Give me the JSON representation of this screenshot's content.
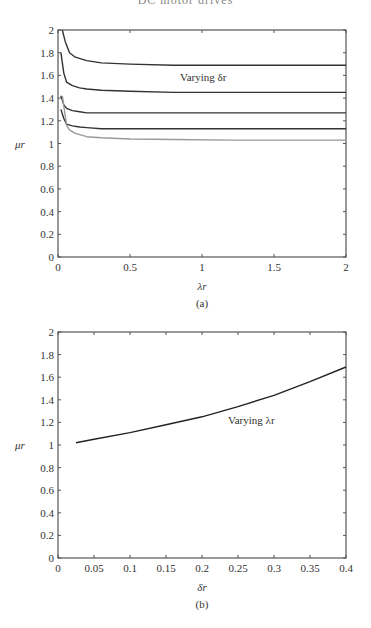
{
  "header": {
    "text": "DC motor drives"
  },
  "chart_data": [
    {
      "type": "line",
      "caption": "(a)",
      "title": "",
      "xlabel": "λr",
      "ylabel": "μr",
      "xlim": [
        0,
        2
      ],
      "ylim": [
        0,
        2
      ],
      "xticks": [
        "0",
        "0.5",
        "1",
        "1.5",
        "2"
      ],
      "yticks": [
        "0",
        "0.2",
        "0.4",
        "0.6",
        "0.8",
        "1",
        "1.2",
        "1.4",
        "1.6",
        "1.8",
        "2"
      ],
      "grid": false,
      "annotation": "Varying δr",
      "series": [
        {
          "name": "curve-1",
          "color": "#333333",
          "x": [
            0.03,
            0.05,
            0.08,
            0.12,
            0.2,
            0.3,
            0.5,
            0.8,
            1.2,
            1.6,
            2.0
          ],
          "y": [
            2.0,
            1.9,
            1.8,
            1.76,
            1.73,
            1.71,
            1.7,
            1.69,
            1.69,
            1.69,
            1.69
          ]
        },
        {
          "name": "curve-2",
          "color": "#333333",
          "x": [
            0.02,
            0.04,
            0.06,
            0.1,
            0.15,
            0.2,
            0.3,
            0.5,
            0.8,
            1.2,
            1.6,
            2.0
          ],
          "y": [
            1.8,
            1.62,
            1.54,
            1.51,
            1.49,
            1.48,
            1.47,
            1.46,
            1.45,
            1.45,
            1.45,
            1.45
          ]
        },
        {
          "name": "curve-3",
          "color": "#333333",
          "x": [
            0.02,
            0.04,
            0.06,
            0.1,
            0.15,
            0.2,
            0.3,
            0.5,
            0.8,
            1.2,
            1.6,
            2.0
          ],
          "y": [
            1.42,
            1.34,
            1.31,
            1.29,
            1.28,
            1.27,
            1.27,
            1.27,
            1.27,
            1.27,
            1.27,
            1.27
          ]
        },
        {
          "name": "curve-4",
          "color": "#333333",
          "x": [
            0.02,
            0.04,
            0.06,
            0.1,
            0.15,
            0.2,
            0.3,
            0.5,
            0.8,
            1.2,
            1.6,
            2.0
          ],
          "y": [
            1.3,
            1.22,
            1.17,
            1.155,
            1.145,
            1.14,
            1.13,
            1.13,
            1.13,
            1.13,
            1.13,
            1.13
          ]
        },
        {
          "name": "curve-5",
          "color": "#999999",
          "x": [
            0.03,
            0.06,
            0.08,
            0.12,
            0.2,
            0.3,
            0.5,
            0.8,
            1.2,
            1.6,
            2.0
          ],
          "y": [
            1.42,
            1.16,
            1.12,
            1.09,
            1.06,
            1.05,
            1.04,
            1.035,
            1.03,
            1.03,
            1.03
          ]
        }
      ]
    },
    {
      "type": "line",
      "caption": "(b)",
      "title": "",
      "xlabel": "δr",
      "ylabel": "μr",
      "xlim": [
        0,
        0.4
      ],
      "ylim": [
        0,
        2
      ],
      "xticks": [
        "0",
        "0.05",
        "0.1",
        "0.15",
        "0.2",
        "0.25",
        "0.3",
        "0.35",
        "0.4"
      ],
      "yticks": [
        "0",
        "0.2",
        "0.4",
        "0.6",
        "0.8",
        "1",
        "1.2",
        "1.4",
        "1.6",
        "1.8",
        "2"
      ],
      "grid": false,
      "annotation": "Varying λr",
      "series": [
        {
          "name": "mu-vs-delta",
          "color": "#222222",
          "x": [
            0.025,
            0.05,
            0.1,
            0.15,
            0.2,
            0.25,
            0.3,
            0.35,
            0.4
          ],
          "y": [
            1.02,
            1.05,
            1.11,
            1.18,
            1.25,
            1.34,
            1.44,
            1.56,
            1.69
          ]
        }
      ]
    }
  ]
}
